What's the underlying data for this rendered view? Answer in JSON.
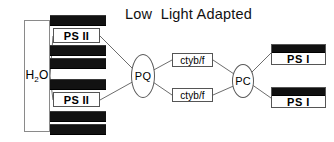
{
  "diagram": {
    "title": "Low  Light Adapted",
    "type": "photosynthetic-electron-transport-chain",
    "water": {
      "label_main": "H",
      "label_sub": "2",
      "label_tail": "O"
    },
    "photosystem_ii": [
      {
        "label": "PS II"
      },
      {
        "label": "PS II"
      }
    ],
    "cytochrome": [
      {
        "label": "ctyb/f"
      },
      {
        "label": "ctyb/f"
      }
    ],
    "photosystem_i": [
      {
        "label": "PS I"
      },
      {
        "label": "PS I"
      }
    ],
    "carriers": [
      {
        "label": "PQ"
      },
      {
        "label": "PC"
      }
    ],
    "antenna_bars": [
      {
        "index": 1
      },
      {
        "index": 2
      },
      {
        "index": 3
      },
      {
        "index": 4
      },
      {
        "index": 5
      },
      {
        "index": 6
      }
    ],
    "colors": {
      "antenna_fill": "#121212",
      "box_border": "#555555",
      "connector": "#6d6d6d",
      "background": "#ffffff",
      "text": "#000000"
    }
  }
}
